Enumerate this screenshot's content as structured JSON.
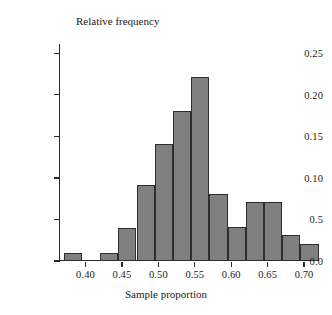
{
  "chart_data": {
    "type": "bar",
    "title": "",
    "ylabel": "Relative frequency",
    "xlabel": "Sample proportion",
    "grid": false,
    "legend": null,
    "xlim": [
      0.365,
      0.715
    ],
    "ylim": [
      0.0,
      0.26
    ],
    "bin_width": 0.025,
    "y_tick_values": [
      0.0,
      0.05,
      0.1,
      0.15,
      0.2,
      0.25
    ],
    "y_tick_labels": [
      "0.0",
      "0.5",
      "0.10",
      "0.15",
      "0.20",
      "0.25"
    ],
    "x_tick_values": [
      0.4,
      0.45,
      0.5,
      0.55,
      0.6,
      0.65,
      0.7
    ],
    "x_tick_labels": [
      "0.40",
      "0.45",
      "0.50",
      "0.55",
      "0.60",
      "0.65",
      "0.70"
    ],
    "bar_color": "#808080",
    "bar_edge_color": "#2e2e2e",
    "axis_color": "#2b2b2b",
    "bins": [
      {
        "left": 0.37,
        "right": 0.395,
        "value": 0.01
      },
      {
        "left": 0.395,
        "right": 0.42,
        "value": 0.0
      },
      {
        "left": 0.42,
        "right": 0.445,
        "value": 0.01
      },
      {
        "left": 0.445,
        "right": 0.47,
        "value": 0.04
      },
      {
        "left": 0.47,
        "right": 0.495,
        "value": 0.092
      },
      {
        "left": 0.495,
        "right": 0.52,
        "value": 0.141
      },
      {
        "left": 0.52,
        "right": 0.545,
        "value": 0.181
      },
      {
        "left": 0.545,
        "right": 0.57,
        "value": 0.221
      },
      {
        "left": 0.57,
        "right": 0.595,
        "value": 0.081
      },
      {
        "left": 0.595,
        "right": 0.62,
        "value": 0.041
      },
      {
        "left": 0.62,
        "right": 0.645,
        "value": 0.071
      },
      {
        "left": 0.645,
        "right": 0.67,
        "value": 0.071
      },
      {
        "left": 0.67,
        "right": 0.695,
        "value": 0.031
      },
      {
        "left": 0.695,
        "right": 0.72,
        "value": 0.021
      }
    ]
  }
}
